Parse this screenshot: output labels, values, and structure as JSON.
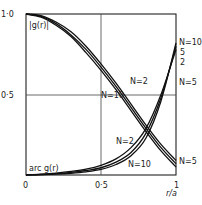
{
  "chart_data": {
    "type": "line",
    "title": "",
    "xlabel": "r/a",
    "ylabel": "",
    "xlim": [
      0,
      1
    ],
    "ylim": [
      0,
      1
    ],
    "grid": {
      "x": [
        0.5
      ],
      "y": [
        0.5
      ]
    },
    "x_ticks": [
      "0",
      "0·5",
      "1"
    ],
    "y_ticks": [
      "1·0",
      "0·5"
    ],
    "x": [
      0,
      0.1,
      0.2,
      0.3,
      0.4,
      0.5,
      0.6,
      0.7,
      0.8,
      0.9,
      1.0
    ],
    "series": [
      {
        "name": "|g(r)| N=2",
        "group": "magnitude",
        "values": [
          1.0,
          0.99,
          0.95,
          0.89,
          0.8,
          0.69,
          0.57,
          0.44,
          0.31,
          0.19,
          0.09
        ]
      },
      {
        "name": "|g(r)| N=5",
        "group": "magnitude",
        "values": [
          1.0,
          0.985,
          0.94,
          0.87,
          0.78,
          0.67,
          0.55,
          0.42,
          0.29,
          0.17,
          0.07
        ]
      },
      {
        "name": "|g(r)| N=10",
        "group": "magnitude",
        "values": [
          1.0,
          0.98,
          0.93,
          0.86,
          0.76,
          0.65,
          0.53,
          0.4,
          0.27,
          0.15,
          0.05
        ]
      },
      {
        "name": "arg g(r) N=2",
        "group": "argument",
        "values": [
          0,
          0.005,
          0.012,
          0.022,
          0.036,
          0.06,
          0.1,
          0.17,
          0.29,
          0.5,
          0.78
        ]
      },
      {
        "name": "arg g(r) N=5",
        "group": "argument",
        "values": [
          0,
          0.003,
          0.008,
          0.016,
          0.028,
          0.045,
          0.08,
          0.14,
          0.26,
          0.48,
          0.8
        ]
      },
      {
        "name": "arg g(r) N=10",
        "group": "argument",
        "values": [
          0,
          0.002,
          0.005,
          0.011,
          0.02,
          0.035,
          0.065,
          0.12,
          0.23,
          0.46,
          0.82
        ]
      }
    ],
    "annotations": [
      {
        "text": "|g(r)|",
        "x": 0.02,
        "y": 0.93
      },
      {
        "text": "arc  g(r)",
        "x": 0.02,
        "y": 0.05
      },
      {
        "text": "N=2",
        "x": 0.65,
        "y": 0.62
      },
      {
        "text": "N=10",
        "x": 0.5,
        "y": 0.5
      },
      {
        "text": "N=2",
        "x": 0.5,
        "y": 0.22
      },
      {
        "text": "N=10",
        "x": 0.62,
        "y": 0.07
      },
      {
        "text": "N=5",
        "x": 1.0,
        "y": 0.06
      },
      {
        "text": "N=10",
        "x": 1.0,
        "y": 0.84
      },
      {
        "text": "5",
        "x": 1.0,
        "y": 0.78
      },
      {
        "text": "2",
        "x": 1.0,
        "y": 0.72
      },
      {
        "text": "N=5",
        "x": 1.0,
        "y": 0.6
      }
    ]
  },
  "labels": {
    "y_top": "1·0",
    "y_mid": "0·5",
    "x_zero": "0",
    "x_mid": "0·5",
    "x_one": "1",
    "x_axis": "r/a",
    "mag_curve": "|g(r)|",
    "arg_curve": "arc  g(r)",
    "n2_upper": "N=2",
    "n10_upper": "N=10",
    "n2_lower": "N=2",
    "n10_lower": "N=10",
    "n5_right_bottom": "N=5",
    "n10_right_top": "N=10",
    "n5_right": "5",
    "n2_right": "2",
    "n5_right_mid": "N=5"
  }
}
